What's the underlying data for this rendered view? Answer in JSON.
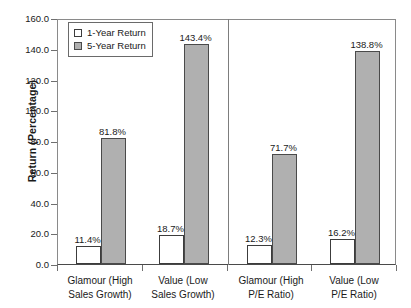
{
  "chart_data": {
    "type": "bar",
    "title": "",
    "xlabel": "",
    "ylabel": "Return (Percentage)",
    "ylim": [
      0,
      160
    ],
    "ytick_step": 20,
    "grid": false,
    "legend_position": "top-left inside plot",
    "yticks": [
      "0.0",
      "20.0",
      "40.0",
      "60.0",
      "80.0",
      "100.0",
      "120.0",
      "140.0",
      "160.0"
    ],
    "categories": [
      "Glamour (High Sales Growth)",
      "Value (Low Sales Growth)",
      "Glamour (High P/E Ratio)",
      "Value (Low P/E Ratio)"
    ],
    "category_lines": [
      [
        "Glamour (High",
        "Sales Growth)"
      ],
      [
        "Value (Low",
        "Sales Growth)"
      ],
      [
        "Glamour (High",
        "P/E Ratio)"
      ],
      [
        "Value (Low",
        "P/E Ratio)"
      ]
    ],
    "series": [
      {
        "name": "1-Year Return",
        "color": "#ffffff",
        "values": [
          11.4,
          18.7,
          12.3,
          16.2
        ],
        "labels": [
          "11.4%",
          "18.7%",
          "12.3%",
          "16.2%"
        ]
      },
      {
        "name": "5-Year Return",
        "color": "#b0b0b0",
        "values": [
          81.8,
          143.4,
          71.7,
          138.8
        ],
        "labels": [
          "81.8%",
          "143.4%",
          "71.7%",
          "138.8%"
        ]
      }
    ],
    "group_divider_after_category": 2
  },
  "legend": {
    "items": [
      {
        "label": "1-Year Return",
        "swatch": "white"
      },
      {
        "label": "5-Year Return",
        "swatch": "gray"
      }
    ]
  },
  "axis": {
    "y_title": "Return (Percentage)"
  },
  "colors": {
    "bar_white": "#ffffff",
    "bar_gray": "#b0b0b0",
    "bar_outline": "#3c3c3c",
    "axis": "#6f6f6f",
    "text": "#1a1a1a"
  }
}
